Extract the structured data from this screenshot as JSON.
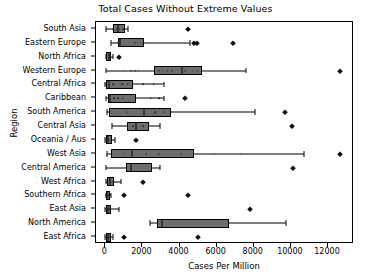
{
  "chart_data": {
    "type": "box",
    "title": "Total Cases Without Extreme Values",
    "xlabel": "Cases Per Million",
    "ylabel": "Region",
    "xlim": [
      -500,
      13400
    ],
    "xticks": [
      0,
      2000,
      4000,
      6000,
      8000,
      10000,
      12000
    ],
    "xticklabels": [
      "0",
      "2000",
      "4000",
      "6000",
      "8000",
      "10000",
      "12000"
    ],
    "grid": false,
    "legend": null,
    "orientation": "horizontal",
    "box_color": "#6d6d6d",
    "line_color": "#000000",
    "categories": [
      "South Asia",
      "Eastern Europe",
      "North Africa",
      "Western Europe",
      "Central Africa",
      "Caribbean",
      "South America",
      "Central Asia",
      "Oceania / Aus",
      "West Asia",
      "Central America",
      "West Africa",
      "Southern Africa",
      "East Asia",
      "North America",
      "East Africa"
    ],
    "boxes": [
      {
        "region": "South Asia",
        "whisker_low": 25,
        "q1": 430,
        "median": 700,
        "q3": 1060,
        "whisker_high": 1230,
        "points": [
          430,
          620,
          780,
          980
        ],
        "fliers": [
          4450
        ]
      },
      {
        "region": "Eastern Europe",
        "whisker_low": 330,
        "q1": 690,
        "median": 780,
        "q3": 2100,
        "whisker_high": 4540,
        "points": [
          700,
          760,
          1600,
          1750,
          1900,
          2050
        ],
        "fliers": [
          4780,
          4930,
          6880
        ]
      },
      {
        "region": "North Africa",
        "whisker_low": 20,
        "q1": 60,
        "median": 180,
        "q3": 330,
        "whisker_high": 420,
        "points": [
          70,
          190,
          300
        ],
        "fliers": [
          760
        ]
      },
      {
        "region": "Western Europe",
        "whisker_low": 30,
        "q1": 2620,
        "median": 4140,
        "q3": 5230,
        "whisker_high": 7570,
        "points": [
          1000,
          1400,
          1600,
          1800,
          2900,
          3100,
          3350,
          3600,
          4300,
          4700,
          4950
        ],
        "fliers": [
          12640
        ]
      },
      {
        "region": "Central Africa",
        "whisker_low": 10,
        "q1": 60,
        "median": 180,
        "q3": 1480,
        "whisker_high": 3170,
        "points": [
          420,
          900,
          1200,
          2050,
          2600
        ],
        "fliers": []
      },
      {
        "region": "Caribbean",
        "whisker_low": 30,
        "q1": 150,
        "median": 260,
        "q3": 1640,
        "whisker_high": 3180,
        "points": [
          480,
          700,
          930,
          2450,
          2900
        ],
        "fliers": [
          4290
        ]
      },
      {
        "region": "South America",
        "whisker_low": 80,
        "q1": 200,
        "median": 2100,
        "q3": 3550,
        "whisker_high": 8050,
        "points": [
          1150,
          2700,
          3150
        ],
        "fliers": [
          9680
        ]
      },
      {
        "region": "Central Asia",
        "whisker_low": 350,
        "q1": 1180,
        "median": 1650,
        "q3": 2350,
        "whisker_high": 2950,
        "points": [
          1500,
          2050
        ],
        "fliers": [
          10050
        ]
      },
      {
        "region": "Oceania / Aus",
        "whisker_low": 10,
        "q1": 40,
        "median": 130,
        "q3": 360,
        "whisker_high": 540,
        "points": [
          80,
          160,
          300
        ],
        "fliers": [
          1630
        ]
      },
      {
        "region": "West Asia",
        "whisker_low": 90,
        "q1": 300,
        "median": 1460,
        "q3": 4780,
        "whisker_high": 10700,
        "points": [
          1050,
          2200,
          2900,
          4100,
          5900,
          7300
        ],
        "fliers": [
          12630
        ]
      },
      {
        "region": "Central America",
        "whisker_low": 40,
        "q1": 1120,
        "median": 1400,
        "q3": 2520,
        "whisker_high": 2950,
        "points": [
          1380
        ],
        "fliers": [
          10100
        ]
      },
      {
        "region": "West Africa",
        "whisker_low": 30,
        "q1": 110,
        "median": 260,
        "q3": 480,
        "whisker_high": 840,
        "points": [
          140,
          260,
          390
        ],
        "fliers": [
          2020
        ]
      },
      {
        "region": "Southern Africa",
        "whisker_low": 15,
        "q1": 40,
        "median": 110,
        "q3": 250,
        "whisker_high": 320,
        "points": [
          60,
          180
        ],
        "fliers": [
          1020,
          4480
        ]
      },
      {
        "region": "East Asia",
        "whisker_low": 10,
        "q1": 50,
        "median": 130,
        "q3": 330,
        "whisker_high": 720,
        "points": [
          90,
          220
        ],
        "fliers": [
          7800
        ]
      },
      {
        "region": "North America",
        "whisker_low": 2420,
        "q1": 2780,
        "median": 3080,
        "q3": 6680,
        "whisker_high": 9750,
        "points": [],
        "fliers": []
      },
      {
        "region": "East Africa",
        "whisker_low": 10,
        "q1": 40,
        "median": 130,
        "q3": 300,
        "whisker_high": 430,
        "points": [
          70,
          150,
          250
        ],
        "fliers": [
          1020,
          4980
        ]
      }
    ]
  }
}
